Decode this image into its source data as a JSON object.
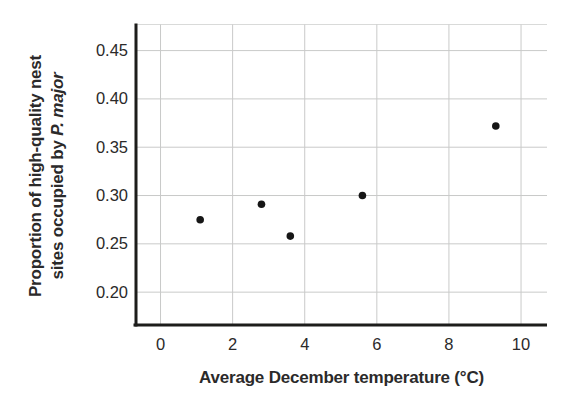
{
  "figure": {
    "background": "#ffffff"
  },
  "chart_data": {
    "type": "scatter",
    "title": "",
    "xlabel": "Average December temperature (°C)",
    "ylabel": "Proportion of high-quality nest sites occupied by P. major",
    "ylabel_lines": [
      {
        "text": "Proportion of high-quality nest",
        "italic_part": ""
      },
      {
        "text": "sites occupied by ",
        "italic_part": "P. major"
      }
    ],
    "points": [
      {
        "x": 1.1,
        "y": 0.275
      },
      {
        "x": 2.8,
        "y": 0.291
      },
      {
        "x": 3.6,
        "y": 0.258
      },
      {
        "x": 5.6,
        "y": 0.3
      },
      {
        "x": 9.3,
        "y": 0.372
      }
    ],
    "x_ticks": [
      0,
      2,
      4,
      6,
      8,
      10
    ],
    "x_tick_labels": [
      "0",
      "2",
      "4",
      "6",
      "8",
      "10"
    ],
    "y_ticks": [
      0.2,
      0.25,
      0.3,
      0.35,
      0.4,
      0.45
    ],
    "y_tick_labels": [
      "0.20",
      "0.25",
      "0.30",
      "0.35",
      "0.40",
      "0.45"
    ],
    "xlim": [
      -0.68,
      10.72
    ],
    "ylim": [
      0.166,
      0.477
    ],
    "grid": true,
    "legend": "none",
    "marker": {
      "shape": "circle",
      "radius_px": 3.8
    },
    "colors": {
      "point": "#161616",
      "axis": "#1d1d1b",
      "gridline": "#c9cac9",
      "top_border": "#d9dad9",
      "text": "#2b2a2a",
      "background": "#ffffff"
    }
  }
}
